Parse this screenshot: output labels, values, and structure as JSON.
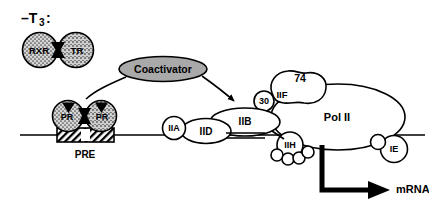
{
  "figure": {
    "title_label": "–T",
    "title_subscript": "3",
    "title_suffix": ":",
    "background_color": "#ffffff",
    "line_color": "#000000"
  },
  "receptor_dimer": {
    "left_label": "RXR",
    "right_label": "TR",
    "fill_color": "#d2d2d2",
    "pattern": "stipple-dots"
  },
  "coactivator": {
    "label": "Coactivator",
    "fill_color": "#a9a9a9"
  },
  "dna": {
    "element_label": "PRE",
    "element_fill": "#ffffff",
    "element_pattern": "diagonal-hatch"
  },
  "receptor_bound": {
    "left_label": "PR",
    "right_label": "PR",
    "fill_color": "#c8c8c8",
    "pattern": "stipple-dots"
  },
  "general_factors": [
    {
      "id": "IIA",
      "label": "IIA"
    },
    {
      "id": "IID",
      "label": "IID"
    },
    {
      "id": "IIB",
      "label": "IIB"
    },
    {
      "id": "30",
      "label": "30"
    },
    {
      "id": "IIF",
      "label": "IIF"
    },
    {
      "id": "74",
      "label": "74"
    },
    {
      "id": "IIH",
      "label": "IIH"
    },
    {
      "id": "IE",
      "label": "IE"
    }
  ],
  "polymerase": {
    "label": "Pol II"
  },
  "transcript": {
    "label": "mRNA",
    "arrow_color": "#000000"
  }
}
